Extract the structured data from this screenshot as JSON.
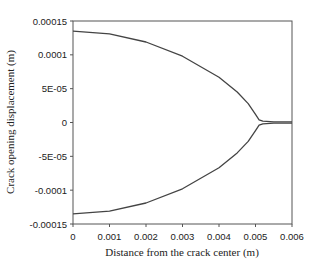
{
  "chart_data": {
    "type": "line",
    "title": "",
    "xlabel": "Distance from the crack center (m)",
    "ylabel": "Crack opening displacement (m)",
    "xlim": [
      0,
      0.006
    ],
    "ylim": [
      -0.00015,
      0.00015
    ],
    "xticks": [
      "0",
      "0.001",
      "0.002",
      "0.003",
      "0.004",
      "0.005",
      "0.006"
    ],
    "yticks": [
      "0.00015",
      "0.0001",
      "5E-05",
      "0",
      "-5E-05",
      "-0.0001",
      "-0.00015"
    ],
    "grid": false,
    "legend": null,
    "series": [
      {
        "name": "upper crack face",
        "x": [
          0,
          0.001,
          0.002,
          0.003,
          0.004,
          0.0045,
          0.0048,
          0.005,
          0.0051,
          0.0052,
          0.0055,
          0.006
        ],
        "y": [
          0.000135,
          0.000131,
          0.000119,
          9.8e-05,
          6.7e-05,
          4.5e-05,
          2.8e-05,
          1.2e-05,
          4e-06,
          2e-06,
          1e-06,
          1e-06
        ]
      },
      {
        "name": "lower crack face",
        "x": [
          0,
          0.001,
          0.002,
          0.003,
          0.004,
          0.0045,
          0.0048,
          0.005,
          0.0051,
          0.0052,
          0.0055,
          0.006
        ],
        "y": [
          -0.000135,
          -0.000131,
          -0.000119,
          -9.8e-05,
          -6.7e-05,
          -4.5e-05,
          -2.8e-05,
          -1.2e-05,
          -4e-06,
          -2e-06,
          -1e-06,
          -1e-06
        ]
      }
    ],
    "line_color": "#444444"
  }
}
